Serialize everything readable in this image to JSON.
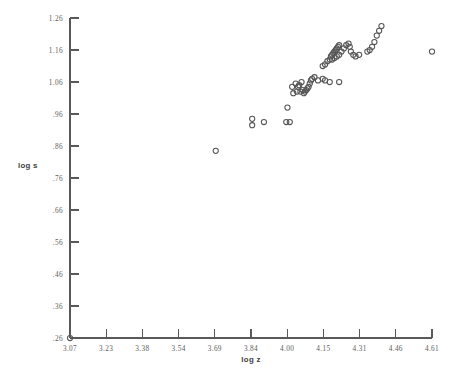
{
  "chart_data": {
    "type": "scatter",
    "title": "",
    "xlabel": "log z",
    "ylabel": "log s",
    "grid": false,
    "legend": "none",
    "xlim": [
      3.07,
      4.61
    ],
    "ylim": [
      0.26,
      1.26
    ],
    "xticks": [
      "3.07",
      "3.23",
      "3.38",
      "3.54",
      "3.69",
      "3.84",
      "4.00",
      "4.15",
      "4.31",
      "4.46",
      "4.61"
    ],
    "yticks": [
      "1.26",
      "1.16",
      "1.06",
      ".96",
      ".86",
      ".76",
      ".66",
      ".56",
      ".46",
      ".36",
      ".26"
    ],
    "marker": "open-circle",
    "marker_color": "#555555",
    "axis_color": "#595959",
    "points": [
      {
        "x": 3.07,
        "y": 0.26
      },
      {
        "x": 3.69,
        "y": 0.845
      },
      {
        "x": 3.845,
        "y": 0.945
      },
      {
        "x": 3.845,
        "y": 0.925
      },
      {
        "x": 3.895,
        "y": 0.935
      },
      {
        "x": 3.995,
        "y": 0.98
      },
      {
        "x": 3.99,
        "y": 0.935
      },
      {
        "x": 4.005,
        "y": 0.935
      },
      {
        "x": 4.015,
        "y": 1.045
      },
      {
        "x": 4.03,
        "y": 1.055
      },
      {
        "x": 4.04,
        "y": 1.045
      },
      {
        "x": 4.045,
        "y": 1.05
      },
      {
        "x": 4.055,
        "y": 1.06
      },
      {
        "x": 4.02,
        "y": 1.025
      },
      {
        "x": 4.035,
        "y": 1.03
      },
      {
        "x": 4.05,
        "y": 1.03
      },
      {
        "x": 4.06,
        "y": 1.035
      },
      {
        "x": 4.065,
        "y": 1.025
      },
      {
        "x": 4.07,
        "y": 1.03
      },
      {
        "x": 4.075,
        "y": 1.035
      },
      {
        "x": 4.08,
        "y": 1.04
      },
      {
        "x": 4.085,
        "y": 1.045
      },
      {
        "x": 4.09,
        "y": 1.055
      },
      {
        "x": 4.095,
        "y": 1.065
      },
      {
        "x": 4.1,
        "y": 1.07
      },
      {
        "x": 4.11,
        "y": 1.075
      },
      {
        "x": 4.125,
        "y": 1.065
      },
      {
        "x": 4.145,
        "y": 1.07
      },
      {
        "x": 4.155,
        "y": 1.065
      },
      {
        "x": 4.175,
        "y": 1.06
      },
      {
        "x": 4.215,
        "y": 1.06
      },
      {
        "x": 4.145,
        "y": 1.11
      },
      {
        "x": 4.155,
        "y": 1.115
      },
      {
        "x": 4.165,
        "y": 1.125
      },
      {
        "x": 4.175,
        "y": 1.13
      },
      {
        "x": 4.18,
        "y": 1.14
      },
      {
        "x": 4.185,
        "y": 1.145
      },
      {
        "x": 4.19,
        "y": 1.15
      },
      {
        "x": 4.195,
        "y": 1.155
      },
      {
        "x": 4.2,
        "y": 1.16
      },
      {
        "x": 4.205,
        "y": 1.165
      },
      {
        "x": 4.21,
        "y": 1.17
      },
      {
        "x": 4.215,
        "y": 1.175
      },
      {
        "x": 4.185,
        "y": 1.13
      },
      {
        "x": 4.195,
        "y": 1.135
      },
      {
        "x": 4.205,
        "y": 1.14
      },
      {
        "x": 4.215,
        "y": 1.145
      },
      {
        "x": 4.225,
        "y": 1.155
      },
      {
        "x": 4.235,
        "y": 1.165
      },
      {
        "x": 4.245,
        "y": 1.175
      },
      {
        "x": 4.255,
        "y": 1.18
      },
      {
        "x": 4.26,
        "y": 1.17
      },
      {
        "x": 4.265,
        "y": 1.155
      },
      {
        "x": 4.275,
        "y": 1.145
      },
      {
        "x": 4.285,
        "y": 1.14
      },
      {
        "x": 4.3,
        "y": 1.145
      },
      {
        "x": 4.335,
        "y": 1.155
      },
      {
        "x": 4.345,
        "y": 1.16
      },
      {
        "x": 4.355,
        "y": 1.17
      },
      {
        "x": 4.365,
        "y": 1.185
      },
      {
        "x": 4.375,
        "y": 1.205
      },
      {
        "x": 4.385,
        "y": 1.22
      },
      {
        "x": 4.395,
        "y": 1.235
      },
      {
        "x": 4.61,
        "y": 1.155
      }
    ]
  },
  "geometry": {
    "plot_left": 70,
    "plot_right": 432,
    "plot_top": 18,
    "plot_bottom": 338
  }
}
